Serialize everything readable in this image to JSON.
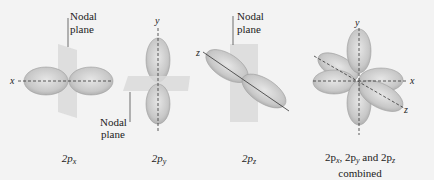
{
  "diagram": {
    "colors": {
      "background": "#f3f3f3",
      "lobe": "#cfcfcf",
      "lobe_edge": "#9a9a9a",
      "plane": "#dcdcdc",
      "axis": "#333333"
    },
    "panels": [
      {
        "id": "2px",
        "axis_labels": [
          "x"
        ],
        "nodal_label_line1": "Nodal",
        "nodal_label_line2": "plane",
        "caption_main": "2p",
        "caption_sub": "x"
      },
      {
        "id": "2py",
        "axis_labels": [
          "y"
        ],
        "nodal_label_line1": "Nodal",
        "nodal_label_line2": "plane",
        "caption_main": "2p",
        "caption_sub": "y"
      },
      {
        "id": "2pz",
        "axis_labels": [
          "z"
        ],
        "nodal_label_line1": "Nodal",
        "nodal_label_line2": "plane",
        "caption_main": "2p",
        "caption_sub": "z"
      },
      {
        "id": "combined",
        "axis_labels": [
          "y",
          "x",
          "z"
        ],
        "caption_line1_parts": [
          "2p",
          "x",
          ", 2p",
          "y",
          " and 2p",
          "z"
        ],
        "caption_line2": "combined"
      }
    ]
  }
}
